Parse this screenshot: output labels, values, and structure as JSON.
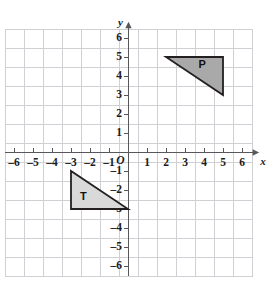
{
  "chart_data": {
    "type": "scatter",
    "title": "",
    "xlabel": "x",
    "ylabel": "y",
    "xlim": [
      -6.5,
      6.5
    ],
    "ylim": [
      -6.5,
      6.5
    ],
    "grid": true,
    "grid_step": 1,
    "origin_label": "O",
    "x_ticks": [
      -6,
      -5,
      -4,
      -3,
      -2,
      -1,
      1,
      2,
      3,
      4,
      5,
      6
    ],
    "x_tick_labels": [
      "–6",
      "–5",
      "–4",
      "–3",
      "–2",
      "–1",
      "1",
      "2",
      "3",
      "4",
      "5",
      "6"
    ],
    "y_ticks": [
      -6,
      -5,
      -4,
      -3,
      -2,
      -1,
      1,
      2,
      3,
      4,
      5,
      6
    ],
    "y_tick_labels": [
      "–6",
      "–5",
      "–4",
      "–3",
      "–2",
      "–1",
      "1",
      "2",
      "3",
      "4",
      "5",
      "6"
    ],
    "shapes": [
      {
        "name": "P",
        "label": "P",
        "kind": "triangle",
        "vertices": [
          [
            2,
            5
          ],
          [
            5,
            5
          ],
          [
            5,
            3
          ]
        ],
        "label_position": [
          3.9,
          4.55
        ],
        "fill": "#a9a9a9",
        "stroke": "#231f20"
      },
      {
        "name": "T",
        "label": "T",
        "kind": "triangle",
        "vertices": [
          [
            -3,
            -1
          ],
          [
            -3,
            -3
          ],
          [
            0,
            -3
          ]
        ],
        "label_position": [
          -2.35,
          -2.35
        ],
        "fill": "#d9d9d9",
        "stroke": "#231f20"
      }
    ]
  },
  "colors": {
    "background": "#ffffff",
    "grid": "#cfcfd4",
    "axis": "#58585c",
    "text": "#1b1b1b",
    "shape_p_fill": "#a9a9a9",
    "shape_t_fill": "#d9d9d9",
    "shape_stroke": "#231f20"
  }
}
